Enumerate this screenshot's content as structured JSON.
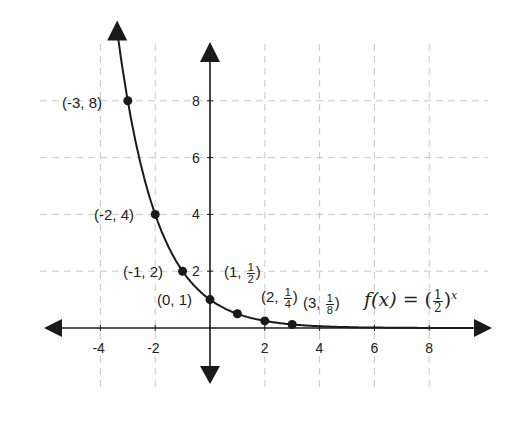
{
  "chart_data": {
    "type": "line",
    "title": "",
    "function_label": {
      "name": "f(x)",
      "equals": "=",
      "base_num": "1",
      "base_den": "2",
      "exponent": "x"
    },
    "xlabel": "",
    "ylabel": "",
    "xlim": [
      -6,
      10
    ],
    "ylim": [
      -1.5,
      10
    ],
    "grid": true,
    "x_ticks": [
      -4,
      -2,
      2,
      4,
      6,
      8
    ],
    "x_tick_labels": [
      "-4",
      "-2",
      "2",
      "4",
      "6",
      "8"
    ],
    "y_ticks": [
      2,
      4,
      6,
      8
    ],
    "y_tick_labels": [
      "2",
      "4",
      "6",
      "8"
    ],
    "series": [
      {
        "name": "f(x) = (1/2)^x",
        "x": [
          -3,
          -2,
          -1,
          0,
          1,
          2,
          3
        ],
        "values": [
          8,
          4,
          2,
          1,
          0.5,
          0.25,
          0.125
        ]
      }
    ],
    "point_labels": [
      {
        "text": "(-3, 8)"
      },
      {
        "text": "(-2, 4)"
      },
      {
        "text": "(-1, 2)"
      },
      {
        "text": "(0, 1)"
      },
      {
        "pre": "(1, ",
        "num": "1",
        "den": "2",
        "post": ")"
      },
      {
        "pre": "(2, ",
        "num": "1",
        "den": "4",
        "post": ")"
      },
      {
        "pre": "(3, ",
        "num": "1",
        "den": "8",
        "post": ")"
      }
    ],
    "colors": {
      "curve": "#1a1a1a",
      "grid": "#c8c8c8",
      "axes": "#1a1a1a"
    }
  }
}
